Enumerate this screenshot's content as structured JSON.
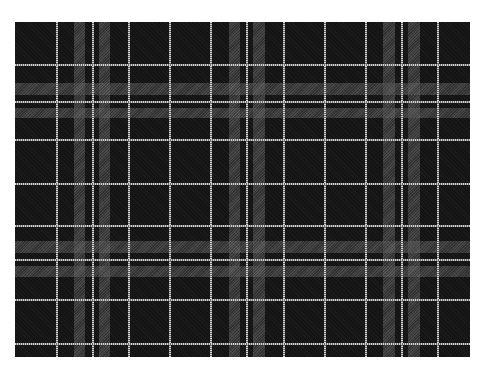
{
  "image": {
    "subject": "tartan plaid fabric pattern",
    "colors": {
      "base": "#141414",
      "band": "#5a5a5a",
      "line": "#d0d0d0"
    },
    "pattern": {
      "vertical_bands": [
        [
          74,
          85
        ],
        [
          99,
          110
        ],
        [
          229,
          240
        ],
        [
          253,
          265
        ],
        [
          383,
          395
        ],
        [
          408,
          420
        ]
      ],
      "vertical_lines": [
        56,
        92,
        128,
        169,
        210,
        246,
        283,
        324,
        365,
        401,
        437
      ],
      "horizontal_bands": [
        [
          83,
          95
        ],
        [
          108,
          118
        ],
        [
          241,
          253
        ],
        [
          266,
          277
        ]
      ],
      "horizontal_lines": [
        64,
        101,
        139,
        183,
        225,
        259,
        299,
        343
      ]
    }
  }
}
